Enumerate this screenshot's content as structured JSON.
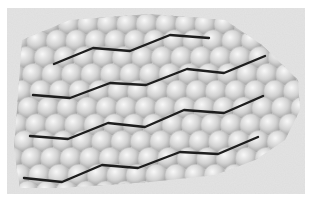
{
  "figure": {
    "width": 313,
    "height": 201,
    "page_background": "#ffffff",
    "panel": {
      "x": 7,
      "y": 8,
      "width": 298,
      "height": 186,
      "fill": "#e4e4e4"
    },
    "sphere_cluster": {
      "description": "close-packed layer of spheres",
      "radius": 11,
      "spacing_x": 19.5,
      "spacing_y": 16.8,
      "origin_x": 30,
      "origin_y": 24,
      "rows": 11,
      "cols": 15,
      "outline": [
        [
          22,
          40
        ],
        [
          70,
          20
        ],
        [
          150,
          14
        ],
        [
          225,
          20
        ],
        [
          262,
          45
        ],
        [
          298,
          80
        ],
        [
          300,
          110
        ],
        [
          285,
          140
        ],
        [
          255,
          160
        ],
        [
          215,
          175
        ],
        [
          150,
          182
        ],
        [
          60,
          188
        ],
        [
          20,
          188
        ],
        [
          14,
          150
        ],
        [
          18,
          95
        ]
      ],
      "highlight_color": "#f8f8f8",
      "mid_color": "#d2d2d2",
      "shadow_color": "#9a9a9a"
    },
    "chains": {
      "stroke": "#1e1e1e",
      "stroke_width": 2.4,
      "lines": [
        {
          "name": "chain-1",
          "points": [
            [
              54,
              64
            ],
            [
              93,
              48
            ],
            [
              130,
              51
            ],
            [
              170,
              35
            ],
            [
              209,
              38
            ]
          ]
        },
        {
          "name": "chain-2",
          "points": [
            [
              33,
              95
            ],
            [
              70,
              98
            ],
            [
              110,
              83
            ],
            [
              146,
              85
            ],
            [
              187,
              69
            ],
            [
              224,
              73
            ],
            [
              265,
              56
            ]
          ]
        },
        {
          "name": "chain-3",
          "points": [
            [
              30,
              136
            ],
            [
              68,
              139
            ],
            [
              108,
              123
            ],
            [
              145,
              127
            ],
            [
              184,
              110
            ],
            [
              224,
              113
            ],
            [
              263,
              96
            ]
          ]
        },
        {
          "name": "chain-4",
          "points": [
            [
              24,
              178
            ],
            [
              62,
              182
            ],
            [
              102,
              165
            ],
            [
              138,
              168
            ],
            [
              180,
              152
            ],
            [
              218,
              154
            ],
            [
              258,
              137
            ]
          ]
        }
      ]
    }
  }
}
